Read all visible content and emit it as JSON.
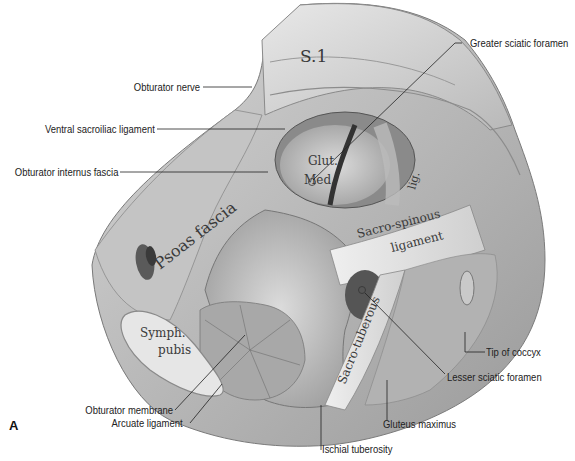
{
  "figure": {
    "panel_letter": "A",
    "structure_labels": {
      "s1": "S.1",
      "psoas_fascia": "Psoas fascia",
      "glut_med_1": "Glut.",
      "glut_med_2": "Med.",
      "lig": "lig.",
      "sacrospinous_1": "Sacro-spinous",
      "sacrospinous_2": "ligament",
      "sacrotuberous": "Sacro-tuberous",
      "symph_1": "Symph.",
      "symph_2": "pubis"
    },
    "callouts": [
      {
        "id": "obturator-nerve",
        "text": "Obturator nerve"
      },
      {
        "id": "ventral-sacroiliac-ligament",
        "text": "Ventral sacroiliac ligament"
      },
      {
        "id": "obturator-internus-fascia",
        "text": "Obturator internus fascia"
      },
      {
        "id": "greater-sciatic-foramen",
        "text": "Greater sciatic foramen"
      },
      {
        "id": "tip-of-coccyx",
        "text": "Tip of coccyx"
      },
      {
        "id": "lesser-sciatic-foramen",
        "text": "Lesser sciatic foramen"
      },
      {
        "id": "gluteus-maximus",
        "text": "Gluteus maximus"
      },
      {
        "id": "ischial-tuberosity",
        "text": "Ischial tuberosity"
      },
      {
        "id": "obturator-membrane",
        "text": "Obturator membrane"
      },
      {
        "id": "arcuate-ligament",
        "text": "Arcuate ligament"
      }
    ]
  }
}
